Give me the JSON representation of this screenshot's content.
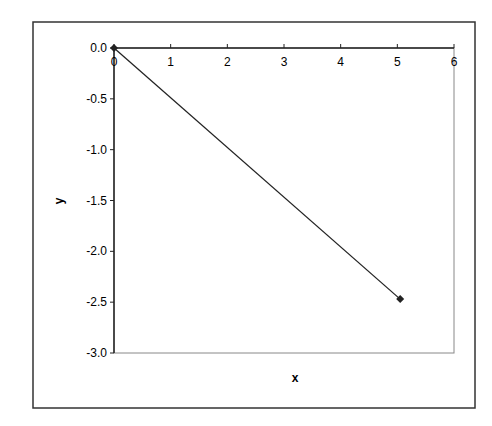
{
  "chart_data": {
    "type": "line",
    "title": "",
    "xlabel": "x",
    "ylabel": "y",
    "xlim": [
      0,
      6
    ],
    "ylim": [
      -3.0,
      0.0
    ],
    "x_ticks": [
      "0",
      "1",
      "2",
      "3",
      "4",
      "5",
      "6"
    ],
    "y_ticks": [
      "0.0",
      "-0.5",
      "-1.0",
      "-1.5",
      "-2.0",
      "-2.5",
      "-3.0"
    ],
    "x_axis_position": "top",
    "grid": false,
    "legend": null,
    "series": [
      {
        "name": "",
        "marker": "diamond",
        "color": "#222222",
        "x": [
          0,
          5.05
        ],
        "y": [
          0.0,
          -2.47
        ]
      }
    ]
  },
  "colors": {
    "line": "#222222",
    "frame": "#333333",
    "plot_border": "#888888"
  }
}
